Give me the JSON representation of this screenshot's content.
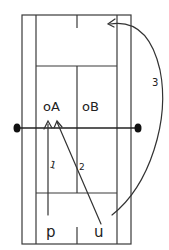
{
  "caption": "",
  "court": {
    "line_color": "#3a3a3a",
    "outer": {
      "x1": 22,
      "y1": 15,
      "x2": 131,
      "y2": 244
    },
    "singles": {
      "left_x": 36,
      "right_x": 117
    },
    "service_lines": {
      "top_y": 66,
      "bottom_y": 193
    },
    "center_x": 77,
    "center_marks": {
      "top": [
        15,
        28
      ],
      "bottom": [
        227,
        244
      ]
    },
    "net": {
      "y": 128,
      "left_post_x": 17,
      "right_post_x": 138,
      "post_color": "#111111"
    }
  },
  "labels": {
    "player_a": "oA",
    "player_b": "oB",
    "player_p": "p",
    "player_u": "u",
    "shot_1": "1",
    "shot_2": "2",
    "shot_3": "3"
  }
}
